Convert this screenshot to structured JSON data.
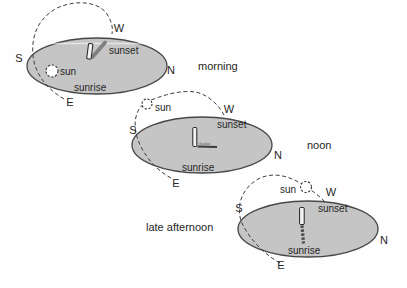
{
  "figure": {
    "background": "#fefefe",
    "ellipse_fill": "#c5c5c5",
    "ellipse_stroke": "#474747",
    "arc_color": "#3f3f3f",
    "text_color": "#262626"
  },
  "diagrams": [
    {
      "time_label": "morning",
      "compass": {
        "west": "W",
        "south": "S",
        "north": "N",
        "east": "E"
      },
      "sun_label": "sun",
      "sunset_label": "sunset",
      "sunrise_label": "sunrise"
    },
    {
      "time_label": "noon",
      "compass": {
        "west": "W",
        "south": "S",
        "north": "N",
        "east": "E"
      },
      "sun_label": "sun",
      "sunset_label": "sunset",
      "sunrise_label": "sunrise",
      "shadow_label": "shadow"
    },
    {
      "time_label": "late afternoon",
      "compass": {
        "west": "W",
        "south": "S",
        "north": "N",
        "east": "E"
      },
      "sun_label": "sun",
      "sunset_label": "sunset",
      "sunrise_label": "sunrise"
    }
  ]
}
